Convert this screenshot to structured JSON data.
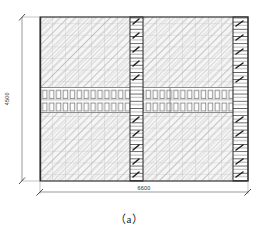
{
  "figure": {
    "caption": "（a）",
    "kind": "masonry-wall-elevation"
  },
  "dimensions": {
    "width_label": "6600",
    "height_label": "4500"
  },
  "drawing": {
    "panel": {
      "x": 40,
      "y": 17,
      "w": 208,
      "h": 164,
      "outline_color": "#3a3a3a",
      "hatch_color": "#8c8c8c",
      "fill_color": "#f2f2f2"
    },
    "brick_grid": {
      "cell_w": 13.0,
      "cell_h": 11.6,
      "line_color": "#9a9a9a"
    },
    "bands": {
      "upper_hatch": {
        "y": 17,
        "h": 70
      },
      "middle_block": {
        "y": 87,
        "h": 26,
        "rows": 2,
        "cols": 30,
        "cell_color": "#ffffff",
        "cell_border": "#7a7a7a"
      },
      "lower_hatch": {
        "y": 113,
        "h": 68
      }
    },
    "columns": [
      {
        "name": "center-column",
        "x": 130,
        "w": 13
      },
      {
        "name": "right-column",
        "x": 233,
        "w": 15
      }
    ],
    "column_style": {
      "band_h": 7.2,
      "band_color": "#ffffff",
      "band_border": "#2e2e2e",
      "tick_color": "#1c1c1c"
    },
    "dimension_lines": {
      "color": "#6e6e6e",
      "horizontal": {
        "x1": 40,
        "x2": 248,
        "y": 192
      },
      "vertical": {
        "y1": 17,
        "y2": 181,
        "x": 22
      },
      "extension_color": "#9a9a9a"
    }
  }
}
